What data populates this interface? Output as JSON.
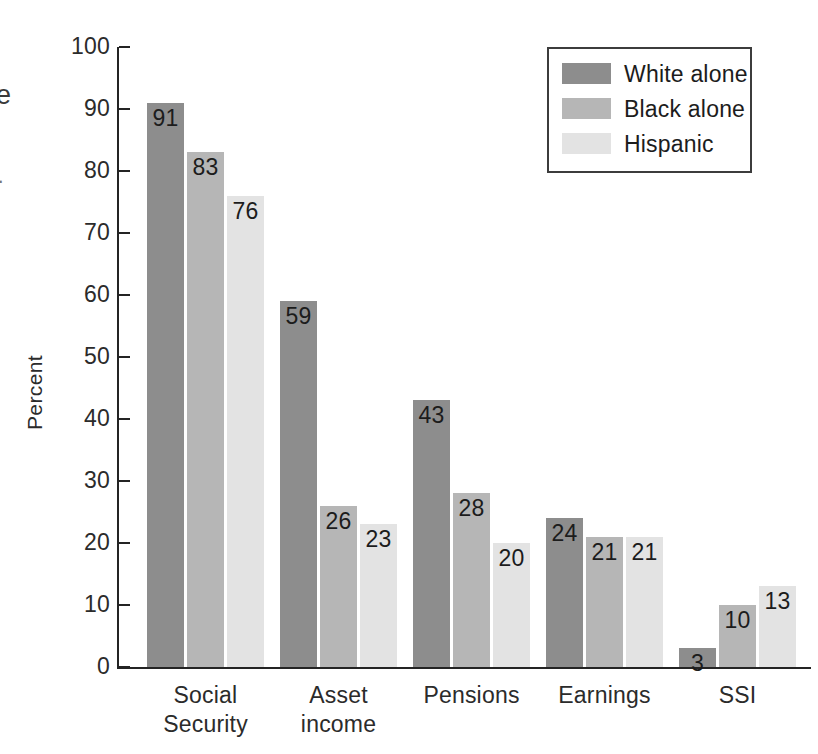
{
  "chart_data": {
    "type": "bar",
    "title": "",
    "subtitle": "",
    "xlabel": "",
    "ylabel": "Percent",
    "ylim": [
      0,
      100
    ],
    "ytick_step": 10,
    "grid": false,
    "legend_position": "top-right",
    "orientation": "vertical",
    "grouping": "grouped",
    "categories": [
      "Social Security",
      "Asset income",
      "Pensions",
      "Earnings",
      "SSI"
    ],
    "category_lines": [
      [
        "Social",
        "Security"
      ],
      [
        "Asset",
        "income"
      ],
      [
        "Pensions"
      ],
      [
        "Earnings"
      ],
      [
        "SSI"
      ]
    ],
    "series": [
      {
        "name": "White alone",
        "color": "#8d8d8d",
        "values": [
          91,
          59,
          43,
          24,
          3
        ]
      },
      {
        "name": "Black alone",
        "color": "#b6b6b6",
        "values": [
          83,
          26,
          28,
          21,
          10
        ]
      },
      {
        "name": "Hispanic",
        "color": "#e3e3e3",
        "values": [
          76,
          23,
          20,
          21,
          13
        ]
      }
    ],
    "y_ticks": [
      {
        "value": 100,
        "label": "100"
      },
      {
        "value": 90,
        "label": "90"
      },
      {
        "value": 80,
        "label": "80"
      },
      {
        "value": 70,
        "label": "70"
      },
      {
        "value": 60,
        "label": "60"
      },
      {
        "value": 50,
        "label": "50"
      },
      {
        "value": 40,
        "label": "40"
      },
      {
        "value": 30,
        "label": "30"
      },
      {
        "value": 20,
        "label": "20"
      },
      {
        "value": 10,
        "label": "10"
      },
      {
        "value": 0,
        "label": "0"
      }
    ],
    "data_labels_shown": true
  },
  "legend": {
    "entries": [
      {
        "label": "White alone",
        "color": "#8d8d8d"
      },
      {
        "label": "Black alone",
        "color": "#b6b6b6"
      },
      {
        "label": "Hispanic",
        "color": "#e3e3e3"
      }
    ]
  },
  "axis": {
    "y_title": "Percent"
  },
  "artifacts": {
    "left_edge_letter": "e",
    "left_edge_mark": "·"
  },
  "colors": {
    "axis": "#242424",
    "text": "#1c1c1c",
    "legend_border": "#3c3c3c",
    "background": "#ffffff"
  }
}
